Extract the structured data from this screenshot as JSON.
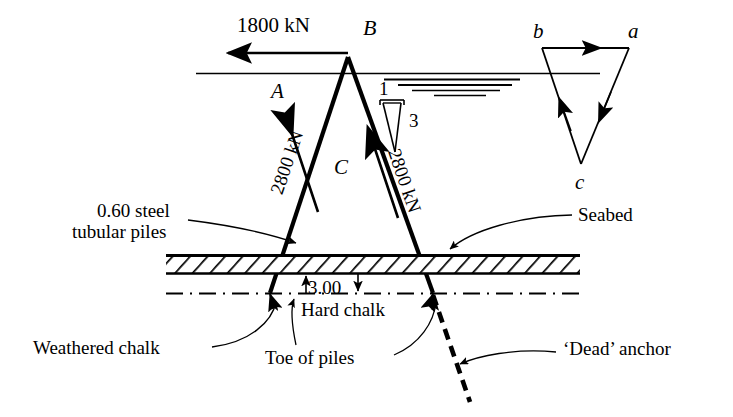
{
  "figure": {
    "kind": "engineering-section-diagram",
    "title_visible": "",
    "colors": {
      "ink": "#000000",
      "paper": "#ffffff"
    }
  },
  "loads": {
    "applied_horizontal": "1800 kN",
    "pile_left_force": "2800 kN",
    "pile_right_force": "2800 kN"
  },
  "nodes": {
    "apex": "B",
    "left_region": "A",
    "center_region": "C"
  },
  "slope_marker": {
    "horizontal": "1",
    "vertical": "3"
  },
  "dimensions": {
    "embedment": "3.00"
  },
  "annotations": {
    "piles": "0.60 steel\ntubular piles",
    "piles_line1": "0.60 steel",
    "piles_line2": "tubular piles",
    "seabed": "Seabed",
    "weathered_chalk": "Weathered chalk",
    "hard_chalk": "Hard chalk",
    "toe_of_piles": "Toe of piles",
    "dead_anchor": "‘Dead’ anchor"
  },
  "force_triangle": {
    "vertex_top_left": "b",
    "vertex_top_right": "a",
    "vertex_bottom": "c"
  }
}
